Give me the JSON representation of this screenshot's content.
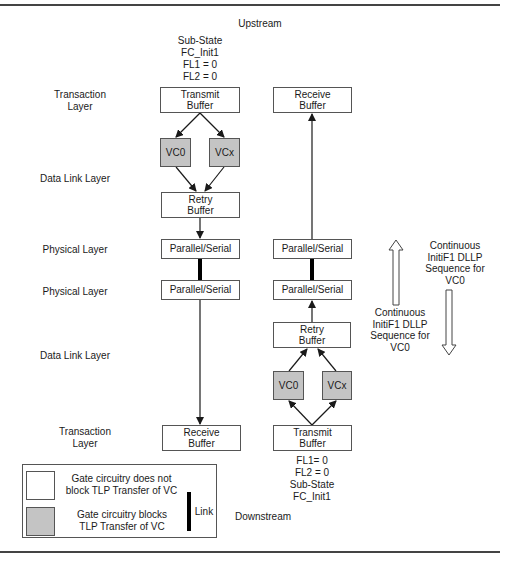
{
  "diagram": {
    "top_label": "Upstream",
    "bottom_label": "Downstream",
    "upstream_state": {
      "line1": "Sub-State",
      "line2": "FC_Init1",
      "line3": "FL1 = 0",
      "line4": "FL2 = 0"
    },
    "downstream_state": {
      "line1": "FL1= 0",
      "line2": "FL2 = 0",
      "line3": "Sub-State",
      "line4": "FC_Init1"
    },
    "layer_labels": {
      "transaction_top": "Transaction\nLayer",
      "data_link_top": "Data Link Layer",
      "physical_top": "Physical Layer",
      "physical_bottom": "Physical Layer",
      "data_link_bottom": "Data Link Layer",
      "transaction_bottom": "Transaction\nLayer"
    },
    "left_column": {
      "transmit_buffer": "Transmit\nBuffer",
      "vc0": "VC0",
      "vcx": "VCx",
      "retry_buffer": "Retry\nBuffer",
      "parallel_serial_top": "Parallel/Serial",
      "parallel_serial_bottom": "Parallel/Serial",
      "receive_buffer": "Receive\nBuffer"
    },
    "right_column": {
      "receive_buffer": "Receive\nBuffer",
      "parallel_serial_top": "Parallel/Serial",
      "parallel_serial_bottom": "Parallel/Serial",
      "retry_buffer": "Retry\nBuffer",
      "vc0": "VC0",
      "vcx": "VCx",
      "transmit_buffer": "Transmit\nBuffer"
    },
    "dllp_up": "Continuous\nInitiF1 DLLP\nSequence for\nVC0",
    "dllp_down": "Continuous\nInitiF1 DLLP\nSequence for\nVC0",
    "legend": {
      "open_gate": "Gate circuitry does not\nblock TLP Transfer of VC",
      "blocked_gate": "Gate circuitry blocks\nTLP Transfer of VC",
      "link": "Link"
    },
    "colors": {
      "blocked_fill": "#c4c4c4",
      "open_fill": "#ffffff",
      "line": "#1a1a1a"
    }
  }
}
